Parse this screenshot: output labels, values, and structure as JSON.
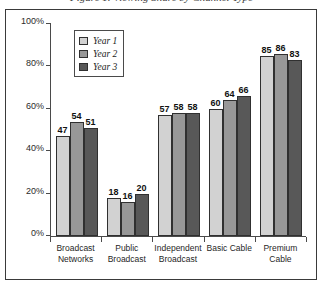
{
  "title": "Figure 1. Viewing Share by Channel Type",
  "chart_data": {
    "type": "bar",
    "title": "Figure 1. Viewing Share by Channel Type",
    "xlabel": "",
    "ylabel": "",
    "ylim": [
      0,
      100
    ],
    "ytick_labels": [
      "100%",
      "80%",
      "60%",
      "40%",
      "20%",
      "0%"
    ],
    "ytick_values": [
      100,
      80,
      60,
      40,
      20,
      0
    ],
    "grid": false,
    "legend_position": "upper-left-inside",
    "categories": [
      "Broadcast Networks",
      "Public Broadcast",
      "Independent Broadcast",
      "Basic Cable",
      "Premium Cable"
    ],
    "category_lines": [
      [
        "Broadcast",
        "Networks"
      ],
      [
        "Public",
        "Broadcast"
      ],
      [
        "Independent",
        "Broadcast"
      ],
      [
        "Basic Cable",
        ""
      ],
      [
        "Premium",
        "Cable"
      ]
    ],
    "series": [
      {
        "name": "Year 1",
        "color": "#d2d2d2",
        "values": [
          47,
          18,
          57,
          60,
          85
        ]
      },
      {
        "name": "Year 2",
        "color": "#989898",
        "values": [
          54,
          16,
          58,
          64,
          86
        ]
      },
      {
        "name": "Year 3",
        "color": "#585858",
        "values": [
          51,
          20,
          58,
          66,
          83
        ]
      }
    ]
  },
  "legend": {
    "items": [
      {
        "label": "Year 1"
      },
      {
        "label": "Year 2"
      },
      {
        "label": "Year 3"
      }
    ]
  }
}
